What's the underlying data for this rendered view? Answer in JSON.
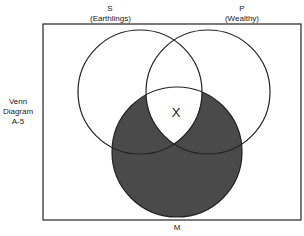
{
  "labels": {
    "s_letter": "S",
    "s_name": "(Earthlings)",
    "p_letter": "P",
    "p_name": "(Wealthy)",
    "m_letter": "M",
    "side_1": "Venn",
    "side_2": "Diagram",
    "side_3": "A-5",
    "mark": "X"
  },
  "colors": {
    "shade": "#4a4a4a",
    "line": "#222222"
  }
}
